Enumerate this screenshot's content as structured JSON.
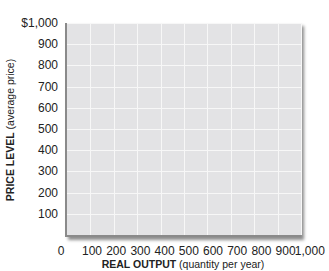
{
  "chart_data": {
    "type": "line",
    "title": "",
    "xlabel_bold": "REAL OUTPUT",
    "xlabel_rest": "(quantity per year)",
    "ylabel_bold": "PRICE LEVEL",
    "ylabel_rest": "(average price)",
    "x_ticks": [
      "0",
      "100",
      "200",
      "300",
      "400",
      "500",
      "600",
      "700",
      "800",
      "900",
      "1,000"
    ],
    "y_ticks": [
      "100",
      "200",
      "300",
      "400",
      "500",
      "600",
      "700",
      "800",
      "900",
      "$1,000"
    ],
    "xlim": [
      0,
      1000
    ],
    "ylim": [
      0,
      1000
    ],
    "grid": true,
    "legend": null,
    "series": [],
    "background": "#e3e3e5",
    "grid_color": "#f7f7f7"
  }
}
